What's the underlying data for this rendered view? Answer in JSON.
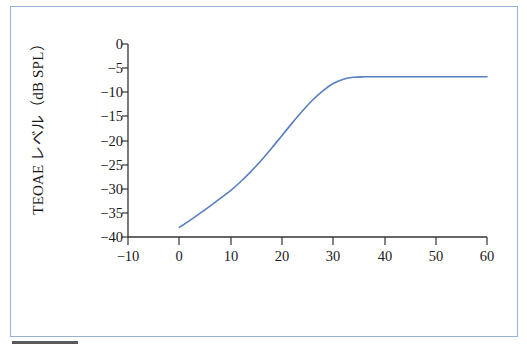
{
  "figure": {
    "background_color": "#ffffff",
    "frame_color": "#9aafd4",
    "rule_color": "#5a5a5a"
  },
  "axes": {
    "line_color": "#333333",
    "x_title": "入力レベル（dB SPL）",
    "y_title": "TEOAE レベル（dB SPL）",
    "x_ticks": [
      "−10",
      "0",
      "10",
      "20",
      "30",
      "40",
      "50",
      "60"
    ],
    "y_ticks": [
      "0",
      "−5",
      "−10",
      "−15",
      "−20",
      "−25",
      "−30",
      "−35",
      "−40"
    ]
  },
  "chart_data": {
    "type": "line",
    "title": "",
    "xlabel": "入力レベル（dB SPL）",
    "ylabel": "TEOAE レベル（dB SPL）",
    "xlim": [
      -10,
      60
    ],
    "ylim": [
      -40,
      0
    ],
    "xticks": [
      -10,
      0,
      10,
      20,
      30,
      40,
      50,
      60
    ],
    "yticks": [
      0,
      -5,
      -10,
      -15,
      -20,
      -25,
      -30,
      -35,
      -40
    ],
    "grid": false,
    "legend": null,
    "line_color": "#5a7fc0",
    "line_width": 1.6,
    "series": [
      {
        "name": "TEOAE input-output function",
        "x": [
          0,
          2,
          4,
          6,
          8,
          10,
          12,
          14,
          16,
          18,
          20,
          22,
          24,
          26,
          28,
          30,
          32,
          34,
          36,
          40,
          45,
          50,
          55,
          60
        ],
        "y": [
          -38.0,
          -36.6,
          -35.1,
          -33.6,
          -32.0,
          -30.4,
          -28.5,
          -26.4,
          -24.1,
          -21.6,
          -19.0,
          -16.4,
          -13.9,
          -11.6,
          -9.7,
          -8.2,
          -7.3,
          -6.9,
          -6.8,
          -6.8,
          -6.8,
          -6.8,
          -6.8,
          -6.8
        ]
      }
    ]
  }
}
